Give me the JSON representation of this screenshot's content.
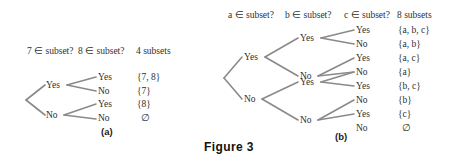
{
  "figure": {
    "caption": "Figure 3",
    "panel_a_label": "(a)",
    "panel_b_label": "(b)",
    "line_color": "#8a8a8a",
    "text_color": "#2f2f2f",
    "background_color": "#ffffff"
  },
  "panel_a": {
    "headers": {
      "col1": "7 ∈ subset?",
      "col2": "8 ∈ subset?",
      "col3": "4 subsets"
    },
    "level1": [
      {
        "label": "Yes"
      },
      {
        "label": "No"
      }
    ],
    "level2": [
      {
        "label": "Yes"
      },
      {
        "label": "No"
      },
      {
        "label": "Yes"
      },
      {
        "label": "No"
      }
    ],
    "results": [
      "{7, 8}",
      "{7}",
      "{8}",
      "∅"
    ]
  },
  "panel_b": {
    "headers": {
      "col1": "a ∈ subset?",
      "col2": "b ∈ subset?",
      "col3": "c ∈ subset?",
      "col4": "8 subsets"
    },
    "level1": [
      {
        "label": "Yes"
      },
      {
        "label": "No"
      }
    ],
    "level2": [
      {
        "label": "Yes"
      },
      {
        "label": "No"
      },
      {
        "label": "Yes"
      },
      {
        "label": "No"
      }
    ],
    "level3": [
      {
        "label": "Yes"
      },
      {
        "label": "No"
      },
      {
        "label": "Yes"
      },
      {
        "label": "No"
      },
      {
        "label": "Yes"
      },
      {
        "label": "No"
      },
      {
        "label": "Yes"
      },
      {
        "label": "No"
      }
    ],
    "results": [
      "{a, b, c}",
      "{a, b}",
      "{a, c}",
      "{a}",
      "{b, c}",
      "{b}",
      "{c}",
      "∅"
    ]
  }
}
